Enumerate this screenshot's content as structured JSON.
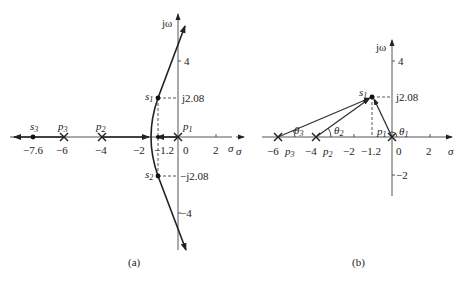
{
  "figure": {
    "panel_a": {
      "caption": "(a)",
      "axis_labels": {
        "imag": "jω",
        "real": "σ"
      },
      "real_ticks": [
        "−7.6",
        "−6",
        "−4",
        "−2",
        "−1.2",
        "0",
        "2"
      ],
      "imag_ticks": [
        "4",
        "j2.08",
        "−j2.08",
        "−4"
      ],
      "points": {
        "s1": {
          "label": "s",
          "sub": "1",
          "re": -1.2,
          "im": 2.08
        },
        "s2": {
          "label": "s",
          "sub": "2",
          "re": -1.2,
          "im": -2.08
        },
        "s3": {
          "label": "s",
          "sub": "3",
          "re": -7.6,
          "im": 0
        }
      },
      "poles": [
        {
          "label": "p",
          "sub": "1",
          "re": 0
        },
        {
          "label": "p",
          "sub": "2",
          "re": -4
        },
        {
          "label": "p",
          "sub": "3",
          "re": -6
        }
      ]
    },
    "panel_b": {
      "caption": "(b)",
      "axis_labels": {
        "imag": "jω",
        "real": "σ"
      },
      "real_ticks": [
        "−6",
        "−4",
        "−2",
        "−1.2",
        "0",
        "2"
      ],
      "imag_ticks": [
        "4",
        "j2.08",
        "−2"
      ],
      "points": {
        "s1": {
          "label": "s",
          "sub": "1",
          "re": -1.2,
          "im": 2.08
        }
      },
      "poles": [
        {
          "label": "p",
          "sub": "1",
          "re": 0
        },
        {
          "label": "p",
          "sub": "2",
          "re": -4
        },
        {
          "label": "p",
          "sub": "3",
          "re": -6
        }
      ],
      "angles": [
        {
          "label": "θ",
          "sub": "1"
        },
        {
          "label": "θ",
          "sub": "2"
        },
        {
          "label": "θ",
          "sub": "3"
        }
      ]
    }
  }
}
